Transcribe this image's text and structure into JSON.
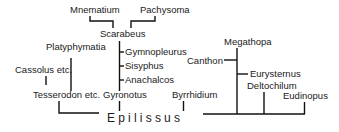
{
  "diagram": {
    "type": "phylogenetic-tree",
    "root": "Epilissus",
    "taxa": {
      "mnematium": "Mnematium",
      "pachysoma": "Pachysoma",
      "scarabeus": "Scarabeus",
      "gymnopleurus": "Gymnopleurus",
      "sisyphus": "Sisyphus",
      "anachalcos": "Anachalcos",
      "platyphymatia": "Platyphymatia",
      "cassolus": "Cassolus etc.",
      "tesserodon": "Tesserodon etc.",
      "gyronotus": "Gyronotus",
      "byrrhidium": "Byrrhidium",
      "megathopa": "Megathopa",
      "canthon": "Canthon",
      "eurysternus": "Eurysternus",
      "deltochilum": "Deltochilum",
      "eudinopus": "Eudinopus"
    },
    "edges": [
      [
        "Mnematium",
        "Scarabeus"
      ],
      [
        "Pachysoma",
        "Scarabeus"
      ],
      [
        "Scarabeus",
        "Gyronotus"
      ],
      [
        "Gymnopleurus",
        "Gyronotus"
      ],
      [
        "Sisyphus",
        "Gyronotus"
      ],
      [
        "Anachalcos",
        "Gyronotus"
      ],
      [
        "Gyronotus",
        "Epilissus"
      ],
      [
        "Platyphymatia",
        "Tesserodon etc."
      ],
      [
        "Cassolus etc.",
        "Tesserodon etc."
      ],
      [
        "Tesserodon etc.",
        "Epilissus"
      ],
      [
        "Byrrhidium",
        "Epilissus"
      ],
      [
        "Megathopa",
        "Epilissus"
      ],
      [
        "Canthon",
        "Megathopa"
      ],
      [
        "Eurysternus",
        "Megathopa"
      ],
      [
        "Deltochilum",
        "Epilissus"
      ],
      [
        "Eudinopus",
        "Epilissus"
      ]
    ]
  }
}
